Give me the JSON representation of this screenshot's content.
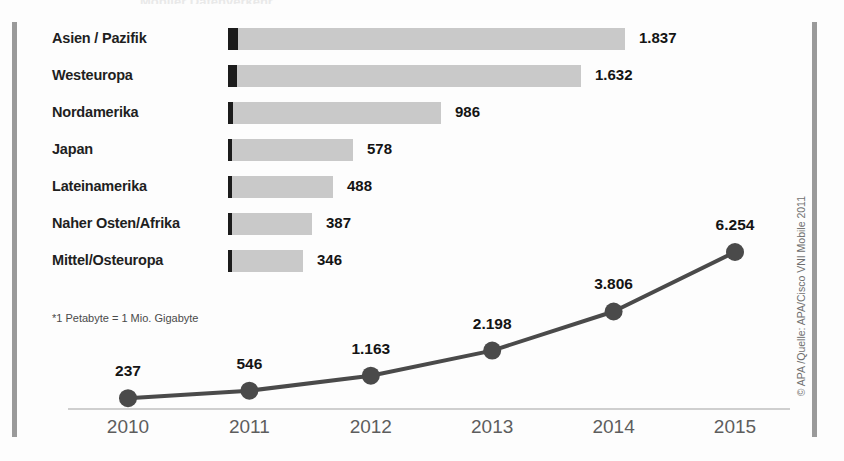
{
  "title_strip": "Mobiler Datenverkehr",
  "footnote": "*1 Petabyte = 1 Mio. Gigabyte",
  "source_credit": "© APA /Quelle: APA/Cisco VNI Mobile 2011",
  "colors": {
    "bar_light": "#c9c9c9",
    "bar_dark": "#1c1c1c",
    "line": "#4a4a4a",
    "marker": "#4a4a4a",
    "axis": "#cfcfcf",
    "edge_rule": "#9a9a9a",
    "text": "#141414",
    "year_text": "#5d5d5d"
  },
  "chart_data": [
    {
      "type": "bar",
      "title": "",
      "orientation": "horizontal",
      "xlabel": "",
      "ylabel": "",
      "grid": false,
      "categories": [
        "Asien / Pazifik",
        "Westeuropa",
        "Nordamerika",
        "Japan",
        "Lateinamerika",
        "Naher Osten/Afrika",
        "Mittel/Osteuropa"
      ],
      "values": [
        1837,
        1632,
        986,
        578,
        488,
        387,
        346
      ],
      "value_labels": [
        "1.837",
        "1.632",
        "986",
        "578",
        "488",
        "387",
        "346"
      ],
      "series": [
        {
          "name": "2010 (dunkler Anteil)",
          "values": [
            46,
            41,
            25,
            14,
            12,
            10,
            9
          ]
        },
        {
          "name": "2015 (Gesamt, Petabyte)",
          "values": [
            1837,
            1632,
            986,
            578,
            488,
            387,
            346
          ]
        }
      ],
      "unit": "Petabyte pro Monat",
      "xlim": [
        0,
        1837
      ]
    },
    {
      "type": "line",
      "title": "",
      "xlabel": "",
      "ylabel": "",
      "grid": false,
      "categories": [
        "2010",
        "2011",
        "2012",
        "2013",
        "2014",
        "2015"
      ],
      "x": [
        2010,
        2011,
        2012,
        2013,
        2014,
        2015
      ],
      "values": [
        237,
        546,
        1163,
        2198,
        3806,
        6254
      ],
      "value_labels": [
        "237",
        "546",
        "1.163",
        "2.198",
        "3.806",
        "6.254"
      ],
      "unit": "Petabyte pro Monat",
      "ylim": [
        0,
        6254
      ],
      "legend": "none"
    }
  ]
}
